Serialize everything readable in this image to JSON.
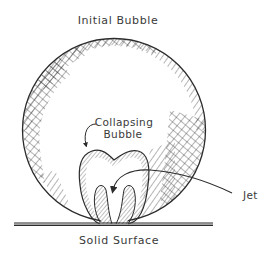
{
  "diagram": {
    "labels": {
      "initial_bubble": "Initial Bubble",
      "collapsing_bubble_line1": "Collapsing",
      "collapsing_bubble_line2": "Bubble",
      "jet": "Jet",
      "solid_surface": "Solid Surface"
    },
    "elements": [
      {
        "id": "initial-bubble",
        "shape": "circle",
        "description": "Large hatched circle resting on the surface"
      },
      {
        "id": "collapsing-bubble",
        "shape": "two-lobed outline with hatching",
        "description": "Deformed bubble with inward jet"
      },
      {
        "id": "jet-arrow",
        "shape": "curved arrow",
        "description": "Arrow pointing into the bubble's center from the Jet label"
      },
      {
        "id": "solid-surface",
        "shape": "horizontal thick line"
      }
    ],
    "colors": {
      "ink": "#2b2b2b",
      "background": "#ffffff"
    }
  }
}
